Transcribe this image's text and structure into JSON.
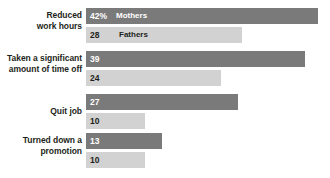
{
  "chart_data": {
    "type": "bar",
    "orientation": "horizontal",
    "title": "",
    "xlabel": "",
    "ylabel": "",
    "grid": false,
    "legend_position": "inline-first-bars",
    "xlim": [
      0,
      42
    ],
    "categories": [
      "Reduced work hours",
      "Taken a significant amount of time off",
      "Quit job",
      "Turned down a promotion"
    ],
    "series": [
      {
        "name": "Mothers",
        "color": "#7a7a7a",
        "values": [
          42,
          39,
          27,
          13
        ],
        "value_labels": [
          "42%",
          "39",
          "27",
          "13"
        ]
      },
      {
        "name": "Fathers",
        "color": "#d2d2d2",
        "values": [
          28,
          24,
          10,
          10
        ],
        "value_labels": [
          "28",
          "24",
          "10",
          "10"
        ]
      }
    ]
  },
  "groups": [
    {
      "label_line1": "Reduced",
      "label_line2": "work hours",
      "mothers": {
        "label": "42%",
        "series_label": "Mothers",
        "width_px": 232
      },
      "fathers": {
        "label": "28",
        "series_label": "Fathers",
        "width_px": 156
      }
    },
    {
      "label_line1": "Taken a significant",
      "label_line2": "amount of time off",
      "mothers": {
        "label": "39",
        "series_label": "",
        "width_px": 219
      },
      "fathers": {
        "label": "24",
        "series_label": "",
        "width_px": 135
      }
    },
    {
      "label_line1": "Quit job",
      "label_line2": "",
      "mothers": {
        "label": "27",
        "series_label": "",
        "width_px": 152
      },
      "fathers": {
        "label": "10",
        "series_label": "",
        "width_px": 59
      }
    },
    {
      "label_line1": "Turned down a",
      "label_line2": "promotion",
      "mothers": {
        "label": "13",
        "series_label": "",
        "width_px": 76
      },
      "fathers": {
        "label": "10",
        "series_label": "",
        "width_px": 59
      }
    }
  ]
}
